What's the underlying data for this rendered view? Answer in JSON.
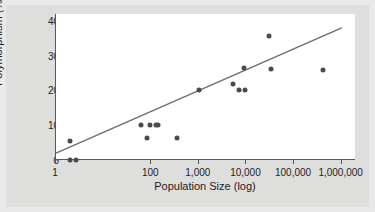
{
  "chart_data": {
    "type": "scatter",
    "title": "",
    "xlabel": "Population Size (log)",
    "ylabel": "Polymorphism (%)",
    "xscale": "log",
    "xlim": [
      1,
      2000000
    ],
    "ylim": [
      0,
      42
    ],
    "grid": false,
    "legend": "none",
    "xticks": [
      {
        "value": 1,
        "label": "1"
      },
      {
        "value": 100,
        "label": "100"
      },
      {
        "value": 1000,
        "label": "1,000"
      },
      {
        "value": 10000,
        "label": "10,000"
      },
      {
        "value": 100000,
        "label": "100,000"
      },
      {
        "value": 1000000,
        "label": "1,000,000"
      }
    ],
    "yticks": [
      {
        "value": 0,
        "label": "0"
      },
      {
        "value": 10,
        "label": "10"
      },
      {
        "value": 20,
        "label": "20"
      },
      {
        "value": 30,
        "label": "30"
      },
      {
        "value": 40,
        "label": "40"
      }
    ],
    "series": [
      {
        "name": "Populations",
        "marker": "circle",
        "color": "#4a4a4e",
        "points": [
          {
            "x": 2,
            "y": 0
          },
          {
            "x": 2.6,
            "y": 0
          },
          {
            "x": 2,
            "y": 5.5
          },
          {
            "x": 60,
            "y": 10
          },
          {
            "x": 80,
            "y": 6.2
          },
          {
            "x": 95,
            "y": 10
          },
          {
            "x": 125,
            "y": 10
          },
          {
            "x": 140,
            "y": 10
          },
          {
            "x": 350,
            "y": 6.2
          },
          {
            "x": 1000,
            "y": 20.2
          },
          {
            "x": 5200,
            "y": 22
          },
          {
            "x": 7000,
            "y": 20.2
          },
          {
            "x": 9500,
            "y": 20.2
          },
          {
            "x": 9000,
            "y": 26.5
          },
          {
            "x": 30000,
            "y": 35.8
          },
          {
            "x": 33000,
            "y": 26.2
          },
          {
            "x": 400000,
            "y": 26.0
          }
        ]
      }
    ],
    "trendline": {
      "color": "#6d6d70",
      "x_start": 1,
      "y_start": 2.0,
      "x_end": 1000000,
      "y_end": 38.0
    }
  }
}
